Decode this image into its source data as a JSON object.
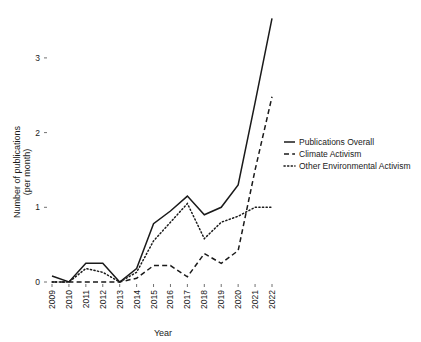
{
  "chart_data": {
    "type": "line",
    "title": "",
    "xlabel": "Year",
    "ylabel": "Number of publications\n(per month)",
    "ylabel_line1": "Number of publications",
    "ylabel_line2": "(per month)",
    "categories": [
      "2009",
      "2010",
      "2011",
      "2012",
      "2013",
      "2014",
      "2015",
      "2016",
      "2017",
      "2018",
      "2019",
      "2020",
      "2021",
      "2022"
    ],
    "x": [
      2009,
      2010,
      2011,
      2012,
      2013,
      2014,
      2015,
      2016,
      2017,
      2018,
      2019,
      2020,
      2021,
      2022
    ],
    "xlim": [
      2009,
      2022
    ],
    "ylim": [
      0,
      3.6
    ],
    "yticks": [
      0,
      1,
      2,
      3
    ],
    "ytick_labels": [
      "0",
      "1",
      "2",
      "3"
    ],
    "grid": false,
    "legend_position": "right",
    "series": [
      {
        "name": "Publications Overall",
        "style": "solid",
        "color": "#1a1a1a",
        "values": [
          0.08,
          0.0,
          0.25,
          0.25,
          0.0,
          0.18,
          0.78,
          0.95,
          1.15,
          0.9,
          1.0,
          1.3,
          2.4,
          3.53
        ]
      },
      {
        "name": "Climate Activism",
        "style": "dashed",
        "color": "#1a1a1a",
        "values": [
          0.0,
          0.0,
          0.0,
          0.0,
          0.0,
          0.05,
          0.22,
          0.22,
          0.07,
          0.38,
          0.25,
          0.42,
          1.5,
          2.48
        ]
      },
      {
        "name": "Other Environmental Activism",
        "style": "dotted",
        "color": "#1a1a1a",
        "values": [
          0.0,
          0.0,
          0.18,
          0.13,
          0.0,
          0.13,
          0.55,
          0.8,
          1.05,
          0.58,
          0.8,
          0.88,
          1.0,
          1.0
        ]
      }
    ]
  },
  "legend": {
    "items": [
      {
        "label": "Publications Overall",
        "style": "solid"
      },
      {
        "label": "Climate Activism",
        "style": "dashed"
      },
      {
        "label": "Other Environmental Activism",
        "style": "dotted"
      }
    ]
  },
  "axes": {
    "x_title": "Year",
    "y_title_line1": "Number of publications",
    "y_title_line2": "(per month)"
  }
}
